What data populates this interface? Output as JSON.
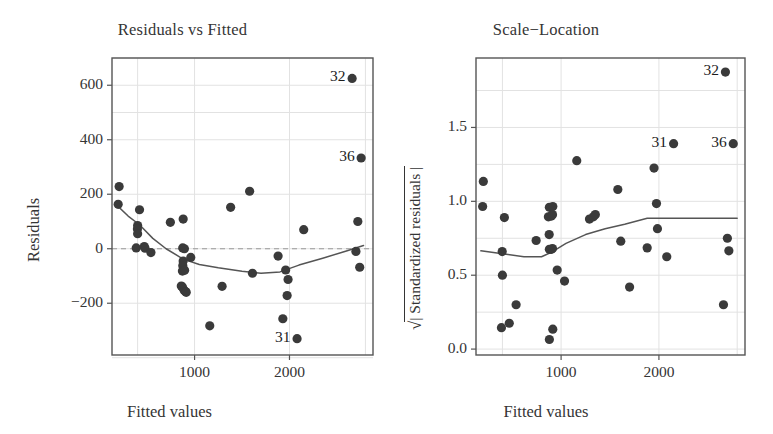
{
  "figure": {
    "background": "#ffffff",
    "point_color": "#3a3a3a",
    "line_color": "#555555",
    "axis_color": "#555555",
    "grid_color": "#e2e2e2"
  },
  "panels": [
    {
      "id": "residuals-vs-fitted",
      "title": "Residuals vs Fitted",
      "xlabel": "Fitted values",
      "ylabel": "Residuals"
    },
    {
      "id": "scale-location",
      "title": "Scale−Location",
      "xlabel": "Fitted values",
      "ylabel_radical": "√",
      "ylabel_inner": "| Standardized residuals |"
    }
  ],
  "chart_data": [
    {
      "type": "scatter",
      "id": "residuals-vs-fitted",
      "title": "Residuals vs Fitted",
      "xlabel": "Fitted values",
      "ylabel": "Residuals",
      "xlim": [
        130,
        2880
      ],
      "ylim": [
        -390,
        700
      ],
      "xticks": [
        1000,
        2000
      ],
      "xticklabels": [
        "1000",
        "2000"
      ],
      "yticks": [
        -200,
        0,
        200,
        400,
        600
      ],
      "yticklabels": [
        "−200",
        "0",
        "200",
        "400",
        "600"
      ],
      "grid": true,
      "zero_reference_line": {
        "y": 0,
        "style": "dashed"
      },
      "points": [
        {
          "x": 205,
          "y": 228
        },
        {
          "x": 195,
          "y": 163
        },
        {
          "x": 420,
          "y": 143
        },
        {
          "x": 400,
          "y": 85
        },
        {
          "x": 398,
          "y": 72
        },
        {
          "x": 400,
          "y": 55
        },
        {
          "x": 385,
          "y": 3
        },
        {
          "x": 470,
          "y": 8
        },
        {
          "x": 478,
          "y": 2
        },
        {
          "x": 540,
          "y": -14
        },
        {
          "x": 745,
          "y": 97
        },
        {
          "x": 880,
          "y": 109
        },
        {
          "x": 875,
          "y": 3
        },
        {
          "x": 893,
          "y": 0
        },
        {
          "x": 880,
          "y": -45
        },
        {
          "x": 876,
          "y": -62
        },
        {
          "x": 872,
          "y": -82
        },
        {
          "x": 895,
          "y": -79
        },
        {
          "x": 860,
          "y": -137
        },
        {
          "x": 872,
          "y": -140
        },
        {
          "x": 890,
          "y": -152
        },
        {
          "x": 903,
          "y": -157
        },
        {
          "x": 912,
          "y": -160
        },
        {
          "x": 960,
          "y": -32
        },
        {
          "x": 1160,
          "y": -283
        },
        {
          "x": 1290,
          "y": -138
        },
        {
          "x": 1380,
          "y": 152
        },
        {
          "x": 1580,
          "y": 211
        },
        {
          "x": 1610,
          "y": -90
        },
        {
          "x": 1880,
          "y": -27
        },
        {
          "x": 1960,
          "y": -78
        },
        {
          "x": 1985,
          "y": -113
        },
        {
          "x": 1975,
          "y": -172
        },
        {
          "x": 1930,
          "y": -257
        },
        {
          "x": 2080,
          "y": -330
        },
        {
          "x": 2150,
          "y": 70
        },
        {
          "x": 2720,
          "y": 100
        },
        {
          "x": 2700,
          "y": -10
        },
        {
          "x": 2740,
          "y": -68
        },
        {
          "x": 2660,
          "y": 625
        },
        {
          "x": 2755,
          "y": 333
        }
      ],
      "smoother": [
        {
          "x": 180,
          "y": 160
        },
        {
          "x": 300,
          "y": 120
        },
        {
          "x": 420,
          "y": 88
        },
        {
          "x": 560,
          "y": 38
        },
        {
          "x": 700,
          "y": 0
        },
        {
          "x": 880,
          "y": -38
        },
        {
          "x": 1050,
          "y": -58
        },
        {
          "x": 1250,
          "y": -70
        },
        {
          "x": 1500,
          "y": -83
        },
        {
          "x": 1700,
          "y": -90
        },
        {
          "x": 1900,
          "y": -85
        },
        {
          "x": 2100,
          "y": -60
        },
        {
          "x": 2350,
          "y": -35
        },
        {
          "x": 2600,
          "y": -8
        },
        {
          "x": 2780,
          "y": 12
        }
      ],
      "annotations": [
        {
          "label": "32",
          "x": 2660,
          "y": 625
        },
        {
          "label": "36",
          "x": 2755,
          "y": 333
        },
        {
          "label": "31",
          "x": 2080,
          "y": -330
        }
      ]
    },
    {
      "type": "scatter",
      "id": "scale-location",
      "title": "Scale−Location",
      "xlabel": "Fitted values",
      "ylabel": "√| Standardized residuals |",
      "xlim": [
        130,
        2880
      ],
      "ylim": [
        -0.04,
        1.97
      ],
      "xticks": [
        1000,
        2000
      ],
      "xticklabels": [
        "1000",
        "2000"
      ],
      "yticks": [
        0.0,
        0.5,
        1.0,
        1.5
      ],
      "yticklabels": [
        "0.0",
        "0.5",
        "1.0",
        "1.5"
      ],
      "grid": true,
      "points": [
        {
          "x": 205,
          "y": 1.135
        },
        {
          "x": 198,
          "y": 0.965
        },
        {
          "x": 420,
          "y": 0.89
        },
        {
          "x": 398,
          "y": 0.66
        },
        {
          "x": 400,
          "y": 0.5
        },
        {
          "x": 390,
          "y": 0.145
        },
        {
          "x": 470,
          "y": 0.175
        },
        {
          "x": 540,
          "y": 0.3
        },
        {
          "x": 745,
          "y": 0.735
        },
        {
          "x": 870,
          "y": 0.895
        },
        {
          "x": 880,
          "y": 0.96
        },
        {
          "x": 900,
          "y": 0.9
        },
        {
          "x": 915,
          "y": 0.965
        },
        {
          "x": 912,
          "y": 0.91
        },
        {
          "x": 878,
          "y": 0.775
        },
        {
          "x": 880,
          "y": 0.675
        },
        {
          "x": 900,
          "y": 0.675
        },
        {
          "x": 912,
          "y": 0.68
        },
        {
          "x": 880,
          "y": 0.065
        },
        {
          "x": 915,
          "y": 0.135
        },
        {
          "x": 960,
          "y": 0.535
        },
        {
          "x": 1035,
          "y": 0.46
        },
        {
          "x": 1160,
          "y": 1.275
        },
        {
          "x": 1290,
          "y": 0.88
        },
        {
          "x": 1330,
          "y": 0.895
        },
        {
          "x": 1350,
          "y": 0.91
        },
        {
          "x": 1580,
          "y": 1.08
        },
        {
          "x": 1610,
          "y": 0.73
        },
        {
          "x": 1700,
          "y": 0.42
        },
        {
          "x": 1880,
          "y": 0.685
        },
        {
          "x": 1950,
          "y": 1.225
        },
        {
          "x": 1975,
          "y": 0.985
        },
        {
          "x": 1985,
          "y": 0.815
        },
        {
          "x": 2080,
          "y": 0.625
        },
        {
          "x": 2150,
          "y": 1.39
        },
        {
          "x": 2700,
          "y": 0.75
        },
        {
          "x": 2715,
          "y": 0.665
        },
        {
          "x": 2660,
          "y": 0.3
        },
        {
          "x": 2680,
          "y": 1.875
        },
        {
          "x": 2760,
          "y": 1.39
        }
      ],
      "smoother": [
        {
          "x": 180,
          "y": 0.665
        },
        {
          "x": 400,
          "y": 0.645
        },
        {
          "x": 620,
          "y": 0.625
        },
        {
          "x": 800,
          "y": 0.625
        },
        {
          "x": 900,
          "y": 0.655
        },
        {
          "x": 1050,
          "y": 0.715
        },
        {
          "x": 1250,
          "y": 0.775
        },
        {
          "x": 1450,
          "y": 0.815
        },
        {
          "x": 1650,
          "y": 0.845
        },
        {
          "x": 1880,
          "y": 0.885
        },
        {
          "x": 2100,
          "y": 0.885
        },
        {
          "x": 2450,
          "y": 0.885
        },
        {
          "x": 2800,
          "y": 0.885
        }
      ],
      "annotations": [
        {
          "label": "32",
          "x": 2680,
          "y": 1.875
        },
        {
          "label": "31",
          "x": 2150,
          "y": 1.39
        },
        {
          "label": "36",
          "x": 2760,
          "y": 1.39
        }
      ]
    }
  ]
}
